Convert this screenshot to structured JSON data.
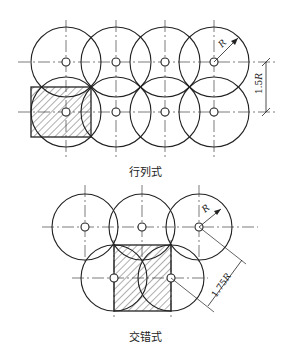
{
  "diagrams": [
    {
      "name": "grid-arrangement",
      "caption": "行列式",
      "radius_label": "R",
      "dimension_label": "1.5R",
      "circle_radius": 35,
      "centers": [
        [
          66,
          62
        ],
        [
          116,
          62
        ],
        [
          165,
          62
        ],
        [
          214,
          62
        ],
        [
          66,
          112
        ],
        [
          116,
          112
        ],
        [
          165,
          112
        ],
        [
          214,
          112
        ]
      ]
    },
    {
      "name": "staggered-arrangement",
      "caption": "交错式",
      "radius_label": "R",
      "dimension_label": "1.75R",
      "circle_radius": 33,
      "centers": [
        [
          85,
          227
        ],
        [
          142,
          227
        ],
        [
          199,
          227
        ],
        [
          114,
          278
        ],
        [
          171,
          278
        ]
      ]
    }
  ],
  "colors": {
    "stroke": "#222222",
    "background": "#ffffff"
  }
}
